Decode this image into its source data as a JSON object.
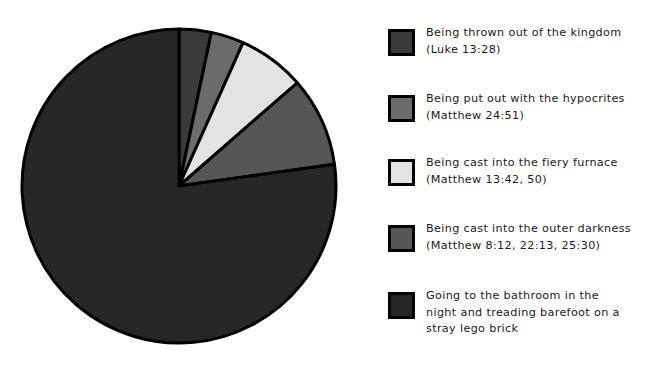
{
  "figure": {
    "background_color": "#ffffff",
    "type": "pie-chart-with-legend"
  },
  "chart_data": {
    "type": "pie",
    "title": "",
    "subtitle": "",
    "xlabel": "",
    "ylabel": "",
    "grid": false,
    "legend_position": "right",
    "start_angle_deg": 0,
    "direction": "clockwise",
    "center_px": {
      "x": 179,
      "y": 186
    },
    "radius_px": 157,
    "edge_color": "#000000",
    "edge_width_px": 3,
    "labels": [
      "Being thrown out of the kingdom (Luke 13:28)",
      "Being put out with the hypocrites (Matthew 24:51)",
      "Being cast into the fiery furnace (Matthew 13:42, 50)",
      "Being cast into the outer darkness (Matthew 8:12, 22:13, 25:30)",
      "Going to the bathroom in the night and treading barefoot on a stray lego brick"
    ],
    "values": [
      3.3,
      3.4,
      6.9,
      9.2,
      77.2
    ],
    "units": "percent",
    "colors": [
      "#3a3a3a",
      "#6b6b6b",
      "#e3e3e3",
      "#565656",
      "#272727"
    ],
    "slices": [
      {
        "label": "Being thrown out of the kingdom",
        "value": 3.3,
        "color": "#3a3a3a",
        "start_deg": 0,
        "end_deg": 11.9
      },
      {
        "label": "Being put out with the hypocrites",
        "value": 3.4,
        "color": "#6b6b6b",
        "start_deg": 11.9,
        "end_deg": 24.1
      },
      {
        "label": "Being cast into the fiery furnace",
        "value": 6.9,
        "color": "#e3e3e3",
        "start_deg": 24.1,
        "end_deg": 48.9
      },
      {
        "label": "Being cast into the outer darkness",
        "value": 9.2,
        "color": "#565656",
        "start_deg": 48.9,
        "end_deg": 82.0
      },
      {
        "label": "Going to the bathroom in the night and treading barefoot on a stray lego brick",
        "value": 77.2,
        "color": "#272727",
        "start_deg": 82.0,
        "end_deg": 360
      }
    ]
  },
  "legend": {
    "items": [
      {
        "line1": "Being thrown out of the kingdom",
        "line2": "(Luke 13:28)",
        "text": "Being thrown out of the kingdom\n(Luke 13:28)",
        "color": "#3a3a3a",
        "top_px": 10
      },
      {
        "line1": "Being put out with the hypocrites",
        "line2": "(Matthew 24:51)",
        "text": "Being put out with the hypocrites\n(Matthew 24:51)",
        "color": "#6b6b6b",
        "top_px": 76
      },
      {
        "line1": "Being cast into the fiery furnace",
        "line2": "(Matthew 13:42, 50)",
        "text": "Being cast into the fiery furnace\n(Matthew 13:42, 50)",
        "color": "#e3e3e3",
        "top_px": 140
      },
      {
        "line1": "Being cast into the outer darkness",
        "line2": "(Matthew 8:12, 22:13, 25:30)",
        "text": "Being cast into the outer darkness\n(Matthew 8:12, 22:13, 25:30)",
        "color": "#565656",
        "top_px": 206
      },
      {
        "line1": "Going to the bathroom in the",
        "line2": "night and treading barefoot on a",
        "line3": "stray lego brick",
        "text": "Going to the bathroom in the\nnight and treading barefoot on a\nstray lego brick",
        "color": "#272727",
        "top_px": 273
      }
    ]
  }
}
